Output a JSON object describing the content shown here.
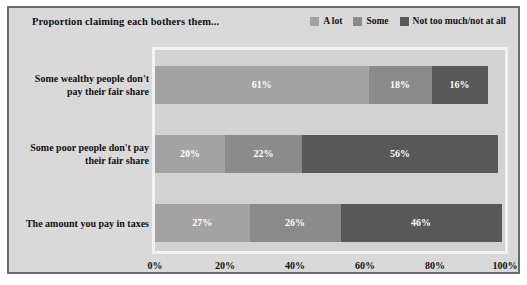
{
  "header": {
    "title": "Proportion claiming each bothers them..."
  },
  "legend": {
    "items": [
      {
        "label": "A lot",
        "color": "#a3a3a3",
        "icon": "legend-swatch-icon"
      },
      {
        "label": "Some",
        "color": "#8b8b8b",
        "icon": "legend-swatch-icon"
      },
      {
        "label": "Not too much/not at all",
        "color": "#585858",
        "icon": "legend-swatch-icon"
      }
    ]
  },
  "axis": {
    "ticks": [
      "0%",
      "20%",
      "40%",
      "60%",
      "80%",
      "100%"
    ]
  },
  "rows": [
    {
      "label_line1": "Some wealthy people don't",
      "label_line2": "pay their fair share",
      "segments": [
        {
          "label": "61%",
          "value": 61,
          "color": "#a3a3a3"
        },
        {
          "label": "18%",
          "value": 18,
          "color": "#8b8b8b"
        },
        {
          "label": "16%",
          "value": 16,
          "color": "#585858"
        }
      ]
    },
    {
      "label_line1": "Some poor people don't pay",
      "label_line2": "their fair share",
      "segments": [
        {
          "label": "20%",
          "value": 20,
          "color": "#a3a3a3"
        },
        {
          "label": "22%",
          "value": 22,
          "color": "#8b8b8b"
        },
        {
          "label": "56%",
          "value": 56,
          "color": "#585858"
        }
      ]
    },
    {
      "label_line1": "The amount you pay in taxes",
      "label_line2": "",
      "segments": [
        {
          "label": "27%",
          "value": 27,
          "color": "#a3a3a3"
        },
        {
          "label": "26%",
          "value": 26,
          "color": "#8b8b8b"
        },
        {
          "label": "46%",
          "value": 46,
          "color": "#585858"
        }
      ]
    }
  ],
  "chart_data": {
    "type": "bar",
    "orientation": "horizontal",
    "stacked": true,
    "title": "Proportion claiming each bothers them...",
    "xlabel": "",
    "ylabel": "",
    "xlim": [
      0,
      100
    ],
    "xticks": [
      0,
      20,
      40,
      60,
      80,
      100
    ],
    "xtick_labels": [
      "0%",
      "20%",
      "40%",
      "60%",
      "80%",
      "100%"
    ],
    "grid": false,
    "legend_position": "top-right",
    "categories": [
      "Some wealthy people don't pay their fair share",
      "Some poor people don't pay their fair share",
      "The amount you pay in taxes"
    ],
    "series": [
      {
        "name": "A lot",
        "color": "#a3a3a3",
        "values": [
          61,
          20,
          27
        ]
      },
      {
        "name": "Some",
        "color": "#8b8b8b",
        "values": [
          18,
          22,
          26
        ]
      },
      {
        "name": "Not too much/not at all",
        "color": "#585858",
        "values": [
          16,
          56,
          46
        ]
      }
    ],
    "data_labels": [
      [
        "61%",
        "18%",
        "16%"
      ],
      [
        "20%",
        "22%",
        "56%"
      ],
      [
        "27%",
        "26%",
        "46%"
      ]
    ]
  }
}
